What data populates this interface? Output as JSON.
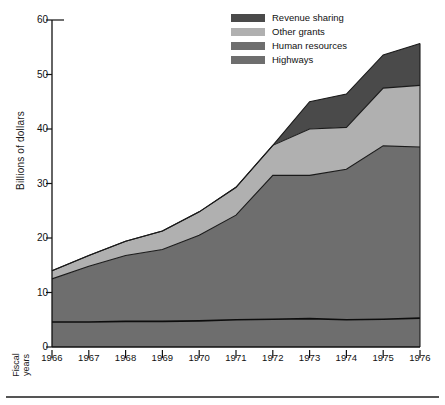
{
  "chart_data": {
    "type": "area",
    "stacked": true,
    "title": "",
    "subtitle": "",
    "xlabel": "Fiscal years",
    "ylabel": "Billions of dollars",
    "x": [
      1966,
      1967,
      1968,
      1969,
      1970,
      1971,
      1972,
      1973,
      1974,
      1975,
      1976
    ],
    "categories": [
      "1966",
      "1967",
      "1968",
      "1969",
      "1970",
      "1971",
      "1972",
      "1973",
      "1974",
      "1975",
      "1976"
    ],
    "xlim": [
      1966,
      1976
    ],
    "ylim": [
      0,
      60
    ],
    "yticks": [
      0,
      10,
      20,
      30,
      40,
      50,
      60
    ],
    "ytick_labels": [
      "0",
      "10",
      "20",
      "30",
      "40",
      "50",
      "60"
    ],
    "grid": false,
    "legend_position": "top-right",
    "series": [
      {
        "name": "Highways",
        "color": "#6e6e6e",
        "values": [
          4.6,
          4.6,
          4.7,
          4.7,
          4.8,
          5.0,
          5.1,
          5.2,
          5.0,
          5.1,
          5.3
        ]
      },
      {
        "name": "Human resources",
        "color": "#6e6e6e",
        "values": [
          7.9,
          10.2,
          12.1,
          13.2,
          15.7,
          19.2,
          26.4,
          26.3,
          27.6,
          31.8,
          31.4
        ]
      },
      {
        "name": "Other grants",
        "color": "#b0b0b0",
        "values": [
          1.5,
          2.0,
          2.6,
          3.4,
          4.3,
          5.1,
          5.5,
          8.5,
          7.7,
          10.6,
          11.3
        ]
      },
      {
        "name": "Revenue sharing",
        "color": "#4a4a4a",
        "values": [
          0,
          0,
          0,
          0,
          0,
          0,
          0,
          5.0,
          6.1,
          6.1,
          7.7
        ]
      }
    ],
    "cumulative_tops": {
      "highways": [
        4.6,
        4.6,
        4.7,
        4.7,
        4.8,
        5.0,
        5.1,
        5.2,
        5.0,
        5.1,
        5.3
      ],
      "human_resources": [
        12.5,
        14.8,
        16.8,
        17.9,
        20.5,
        24.2,
        31.5,
        31.5,
        32.6,
        36.9,
        36.7
      ],
      "other_grants": [
        14.0,
        16.8,
        19.4,
        21.3,
        24.8,
        29.3,
        37.0,
        40.0,
        40.3,
        47.5,
        48.0
      ],
      "revenue_sharing": [
        14.0,
        16.8,
        19.4,
        21.3,
        24.8,
        29.3,
        37.0,
        45.0,
        46.4,
        53.6,
        55.7
      ]
    }
  },
  "legend": {
    "items": [
      {
        "label": "Revenue sharing",
        "color": "#4a4a4a"
      },
      {
        "label": "Other grants",
        "color": "#b0b0b0"
      },
      {
        "label": "Human resources",
        "color": "#6e6e6e"
      },
      {
        "label": "Highways",
        "color": "#6e6e6e"
      }
    ]
  },
  "axes": {
    "y_title": "Billions of dollars",
    "x_title": "Fiscal\nyears"
  },
  "colors": {
    "revenue_sharing": "#4a4a4a",
    "other_grants": "#b0b0b0",
    "human_resources": "#6e6e6e",
    "highways": "#6e6e6e",
    "axis": "#111111",
    "outline": "#1a1a1a",
    "background": "#ffffff"
  }
}
